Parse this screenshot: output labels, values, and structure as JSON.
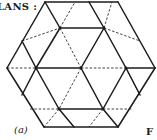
{
  "header": {
    "title_fragment": "LANS :"
  },
  "figure": {
    "caption": "(a)",
    "fig_label_fragment": "F"
  },
  "diagram": {
    "shape": "hexagon-triangular-lattice",
    "colors": {
      "line": "#1c1c1c",
      "background": "#ffffff"
    },
    "vertices": {
      "TL": [
        45,
        2
      ],
      "TR": [
        118,
        2
      ],
      "R": [
        155,
        68
      ],
      "BR": [
        118,
        127
      ],
      "BL": [
        44,
        127
      ],
      "L": [
        7,
        68
      ]
    },
    "nodes": {
      "n1": [
        60,
        28
      ],
      "n2": [
        104,
        28
      ],
      "n3": [
        36,
        68
      ],
      "n4": [
        81,
        68
      ],
      "n5": [
        126,
        68
      ],
      "n6": [
        59,
        109
      ],
      "n7": [
        103,
        109
      ]
    },
    "solid_segments": [
      [
        [
          45,
          2
        ],
        [
          118,
          2
        ]
      ],
      [
        [
          118,
          2
        ],
        [
          155,
          68
        ]
      ],
      [
        [
          155,
          68
        ],
        [
          118,
          127
        ]
      ],
      [
        [
          118,
          127
        ],
        [
          44,
          127
        ]
      ],
      [
        [
          44,
          127
        ],
        [
          7,
          68
        ]
      ],
      [
        [
          7,
          68
        ],
        [
          45,
          2
        ]
      ],
      [
        [
          45,
          2
        ],
        [
          60,
          28
        ]
      ],
      [
        [
          60,
          28
        ],
        [
          104,
          28
        ]
      ],
      [
        [
          89,
          2
        ],
        [
          104,
          28
        ]
      ],
      [
        [
          104,
          28
        ],
        [
          81,
          68
        ]
      ],
      [
        [
          60,
          28
        ],
        [
          36,
          68
        ]
      ],
      [
        [
          36,
          68
        ],
        [
          81,
          68
        ]
      ],
      [
        [
          36,
          68
        ],
        [
          59,
          109
        ]
      ],
      [
        [
          59,
          109
        ],
        [
          103,
          109
        ]
      ],
      [
        [
          81,
          68
        ],
        [
          103,
          109
        ]
      ],
      [
        [
          126,
          68
        ],
        [
          103,
          109
        ]
      ],
      [
        [
          126,
          68
        ],
        [
          155,
          68
        ]
      ],
      [
        [
          104,
          28
        ],
        [
          126,
          68
        ]
      ],
      [
        [
          59,
          109
        ],
        [
          74,
          127
        ]
      ],
      [
        [
          103,
          109
        ],
        [
          118,
          127
        ]
      ],
      [
        [
          22,
          95
        ],
        [
          36,
          68
        ]
      ],
      [
        [
          36,
          68
        ],
        [
          22,
          41
        ]
      ],
      [
        [
          140,
          95
        ],
        [
          126,
          68
        ]
      ]
    ],
    "dashed_segments": [
      [
        [
          60,
          28
        ],
        [
          75,
          2
        ]
      ],
      [
        [
          104,
          28
        ],
        [
          112,
          2
        ]
      ],
      [
        [
          7,
          68
        ],
        [
          36,
          68
        ]
      ],
      [
        [
          60,
          28
        ],
        [
          81,
          68
        ]
      ],
      [
        [
          81,
          68
        ],
        [
          126,
          68
        ]
      ],
      [
        [
          81,
          68
        ],
        [
          59,
          109
        ]
      ],
      [
        [
          30,
          109
        ],
        [
          59,
          109
        ]
      ],
      [
        [
          22,
          41
        ],
        [
          60,
          28
        ]
      ],
      [
        [
          104,
          28
        ],
        [
          140,
          41
        ]
      ],
      [
        [
          126,
          68
        ],
        [
          140,
          95
        ]
      ],
      [
        [
          103,
          109
        ],
        [
          132,
          109
        ]
      ],
      [
        [
          59,
          109
        ],
        [
          44,
          127
        ]
      ],
      [
        [
          103,
          109
        ],
        [
          89,
          127
        ]
      ]
    ]
  }
}
